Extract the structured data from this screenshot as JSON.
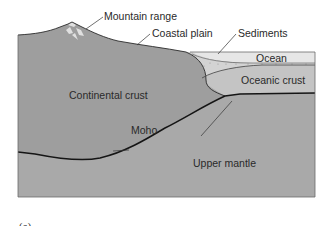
{
  "figure": {
    "caption": "(a)",
    "colors": {
      "continental_crust": "#9e9e9e",
      "upper_mantle": "#a9a9a9",
      "oceanic_crust": "#c4c4c4",
      "ocean": "#e6e6e6",
      "sediments": "#d3d3d3",
      "moho_line": "#151515",
      "border": "#6a6a6a",
      "mountain_snow": "#e8e8e8"
    },
    "labels": {
      "mountain_range": "Mountain range",
      "coastal_plain": "Coastal plain",
      "sediments": "Sediments",
      "ocean": "Ocean",
      "oceanic_crust": "Oceanic crust",
      "continental_crust": "Continental crust",
      "moho": "Moho",
      "upper_mantle": "Upper mantle"
    }
  }
}
